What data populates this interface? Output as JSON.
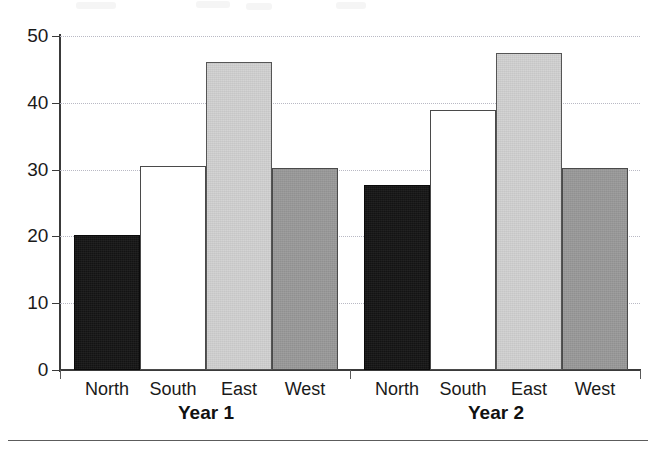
{
  "chart_data": {
    "type": "bar",
    "title": "",
    "subtitle": "",
    "xlabel": "",
    "ylabel": "",
    "ylim": [
      0,
      50
    ],
    "yticks": [
      0,
      10,
      20,
      30,
      40,
      50
    ],
    "ytick_labels": [
      "0",
      "10",
      "20",
      "30",
      "40",
      "50"
    ],
    "grid": true,
    "grid_axis": "y",
    "grid_style": "dotted",
    "legend": false,
    "legend_position": "none",
    "categories": [
      "North",
      "South",
      "East",
      "West"
    ],
    "groups": [
      "Year 1",
      "Year 2"
    ],
    "series": [
      {
        "name": "Year 1",
        "values": [
          20.2,
          30.5,
          46.1,
          30.2
        ]
      },
      {
        "name": "Year 2",
        "values": [
          27.7,
          38.9,
          47.5,
          30.2
        ]
      }
    ],
    "bar_fills": [
      "black",
      "white",
      "light-gray",
      "medium-gray"
    ],
    "colors": {
      "north": "#151515",
      "south": "#ffffff",
      "east": "#d2d2d2",
      "west": "#9a9a9a",
      "axis": "#3a3a3a",
      "gridline": "#b9b9c4",
      "text": "#1a1a1a",
      "background": "#ffffff"
    }
  },
  "axis": {
    "y_ticks": [
      {
        "label": "50",
        "value": 50
      },
      {
        "label": "40",
        "value": 40
      },
      {
        "label": "30",
        "value": 30
      },
      {
        "label": "20",
        "value": 20
      },
      {
        "label": "10",
        "value": 10
      },
      {
        "label": "0",
        "value": 0
      }
    ]
  },
  "groups": [
    {
      "label": "Year 1",
      "bars": [
        {
          "label": "North",
          "value": 20.2,
          "fill": "black"
        },
        {
          "label": "South",
          "value": 30.5,
          "fill": "white"
        },
        {
          "label": "East",
          "value": 46.1,
          "fill": "light"
        },
        {
          "label": "West",
          "value": 30.2,
          "fill": "medium"
        }
      ]
    },
    {
      "label": "Year 2",
      "bars": [
        {
          "label": "North",
          "value": 27.7,
          "fill": "black"
        },
        {
          "label": "South",
          "value": 38.9,
          "fill": "white"
        },
        {
          "label": "East",
          "value": 47.5,
          "fill": "light"
        },
        {
          "label": "West",
          "value": 30.2,
          "fill": "medium"
        }
      ]
    }
  ]
}
